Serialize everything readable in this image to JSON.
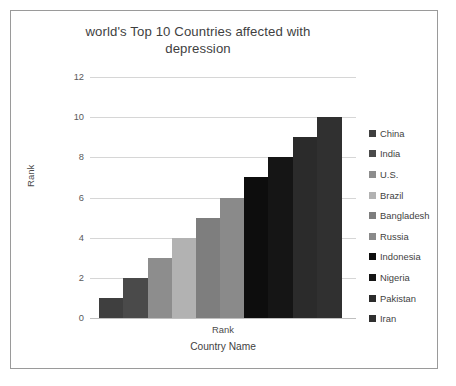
{
  "frame": {
    "border_color": "#9a9a9a",
    "background": "#ffffff"
  },
  "title": "world's Top 10 Countries affected with depression",
  "y_axis": {
    "title": "Rank",
    "ticks": [
      "12",
      "10",
      "8",
      "6",
      "4",
      "2",
      "0"
    ]
  },
  "x_axis": {
    "category_label": "Rank",
    "title": "Country Name"
  },
  "legend": {
    "position": "right",
    "items": [
      {
        "label": "China",
        "color": "#3f3f3f"
      },
      {
        "label": "India",
        "color": "#4a4a4a"
      },
      {
        "label": "U.S.",
        "color": "#8d8d8d"
      },
      {
        "label": "Brazil",
        "color": "#b2b2b2"
      },
      {
        "label": "Bangladesh",
        "color": "#7e7e7e"
      },
      {
        "label": "Russia",
        "color": "#8a8a8a"
      },
      {
        "label": "Indonesia",
        "color": "#0d0d0d"
      },
      {
        "label": "Nigeria",
        "color": "#151515"
      },
      {
        "label": "Pakistan",
        "color": "#2b2b2b"
      },
      {
        "label": "Iran",
        "color": "#303030"
      }
    ]
  },
  "chart_data": {
    "type": "bar",
    "title": "world's Top 10 Countries affected with depression",
    "xlabel": "Country Name",
    "ylabel": "Rank",
    "ylim": [
      0,
      12
    ],
    "yticks": [
      0,
      2,
      4,
      6,
      8,
      10,
      12
    ],
    "grid": "horizontal",
    "legend_position": "right",
    "categories": [
      "China",
      "India",
      "U.S.",
      "Brazil",
      "Bangladesh",
      "Russia",
      "Indonesia",
      "Nigeria",
      "Pakistan",
      "Iran"
    ],
    "values": [
      1,
      2,
      3,
      4,
      5,
      6,
      7,
      8,
      9,
      10
    ],
    "colors": [
      "#3f3f3f",
      "#4a4a4a",
      "#8d8d8d",
      "#b2b2b2",
      "#7e7e7e",
      "#8a8a8a",
      "#0d0d0d",
      "#151515",
      "#2b2b2b",
      "#303030"
    ],
    "series": [
      {
        "name": "Rank",
        "values": [
          1,
          2,
          3,
          4,
          5,
          6,
          7,
          8,
          9,
          10
        ]
      }
    ]
  }
}
